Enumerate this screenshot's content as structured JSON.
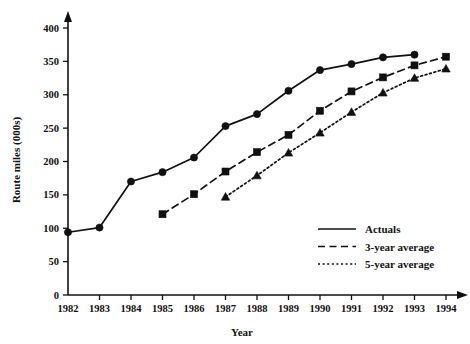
{
  "chart_data": {
    "type": "line",
    "title": "",
    "xlabel": "Year",
    "ylabel": "Route miles (000s)",
    "categories": [
      1982,
      1983,
      1984,
      1985,
      1986,
      1987,
      1988,
      1989,
      1990,
      1991,
      1992,
      1993,
      1994
    ],
    "xticklabels": [
      "1982",
      "1983",
      "1984",
      "1985",
      "1986",
      "1987",
      "1988",
      "1989",
      "1990",
      "1991",
      "1992",
      "1993",
      "1994"
    ],
    "yticklabels": [
      "0",
      "50",
      "100",
      "150",
      "200",
      "250",
      "300",
      "350",
      "400"
    ],
    "yticks": [
      0,
      50,
      100,
      150,
      200,
      250,
      300,
      350,
      400
    ],
    "ylim": [
      0,
      415
    ],
    "xlim": [
      1982,
      1994.6
    ],
    "grid": false,
    "legend_position": "lower-right",
    "series": [
      {
        "name": "Actuals",
        "style": "solid",
        "marker": "circle",
        "x": [
          1982,
          1983,
          1984,
          1985,
          1986,
          1987,
          1988,
          1989,
          1990,
          1991,
          1992,
          1993
        ],
        "values": [
          94,
          101,
          170,
          184,
          206,
          253,
          271,
          306,
          337,
          346,
          356,
          360
        ]
      },
      {
        "name": "3-year average",
        "style": "dashed",
        "marker": "square",
        "x": [
          1985,
          1986,
          1987,
          1988,
          1989,
          1990,
          1991,
          1992,
          1993,
          1994
        ],
        "values": [
          121,
          151,
          185,
          214,
          240,
          276,
          305,
          326,
          344,
          357
        ]
      },
      {
        "name": "5-year average",
        "style": "dotted",
        "marker": "triangle",
        "x": [
          1987,
          1988,
          1989,
          1990,
          1991,
          1992,
          1993,
          1994
        ],
        "values": [
          147,
          179,
          213,
          243,
          274,
          303,
          325,
          339
        ]
      }
    ]
  },
  "legend": {
    "items": [
      {
        "label": "Actuals",
        "swatch": "solid-line-swatch"
      },
      {
        "label": "3-year average",
        "swatch": "dashed-line-swatch"
      },
      {
        "label": "5-year average",
        "swatch": "dotted-line-swatch"
      }
    ]
  },
  "axes": {
    "x_title": "Year",
    "y_title": "Route miles (000s)"
  }
}
